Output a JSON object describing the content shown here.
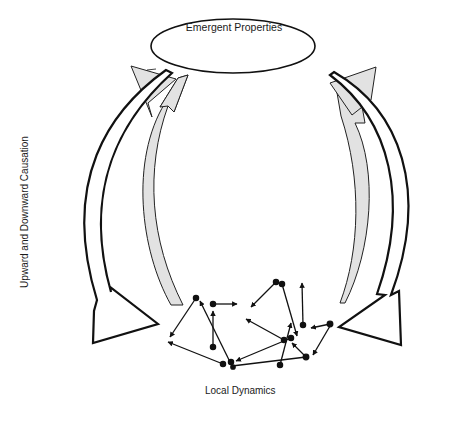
{
  "diagram": {
    "top_node": {
      "label": "Emergent Properties"
    },
    "bottom_node": {
      "label": "Local Dynamics"
    },
    "side_label": "Upward and Downward Causation",
    "colors": {
      "stroke": "#111111",
      "upward_fill": "#e2e2e2",
      "downward_fill": "#ffffff",
      "background": "#ffffff"
    },
    "arrows": {
      "left_upward": {
        "direction": "up",
        "fill": "gray"
      },
      "left_downward": {
        "direction": "down",
        "fill": "white"
      },
      "right_upward": {
        "direction": "up",
        "fill": "gray"
      },
      "right_downward": {
        "direction": "down",
        "fill": "white"
      }
    },
    "network": {
      "nodes": [
        [
          196,
          298
        ],
        [
          213,
          304
        ],
        [
          213,
          347
        ],
        [
          223,
          364
        ],
        [
          232,
          366
        ],
        [
          276,
          282
        ],
        [
          282,
          284
        ],
        [
          303,
          325
        ],
        [
          284,
          340
        ],
        [
          291,
          338
        ],
        [
          330,
          324
        ],
        [
          306,
          357
        ],
        [
          280,
          365
        ]
      ],
      "edges": [
        [
          [
            196,
            298
          ],
          [
            170,
            337
          ]
        ],
        [
          [
            213,
            304
          ],
          [
            237,
            304
          ]
        ],
        [
          [
            213,
            347
          ],
          [
            213,
            311
          ]
        ],
        [
          [
            223,
            364
          ],
          [
            168,
            342
          ]
        ],
        [
          [
            232,
            366
          ],
          [
            200,
            301
          ]
        ],
        [
          [
            276,
            282
          ],
          [
            251,
            307
          ]
        ],
        [
          [
            282,
            284
          ],
          [
            297,
            336
          ]
        ],
        [
          [
            303,
            325
          ],
          [
            302,
            283
          ]
        ],
        [
          [
            284,
            340
          ],
          [
            246,
            319
          ]
        ],
        [
          [
            291,
            338
          ],
          [
            236,
            361
          ]
        ],
        [
          [
            330,
            324
          ],
          [
            311,
            328
          ]
        ],
        [
          [
            330,
            326
          ],
          [
            313,
            355
          ]
        ],
        [
          [
            306,
            357
          ],
          [
            292,
            343
          ]
        ],
        [
          [
            280,
            365
          ],
          [
            291,
            323
          ]
        ],
        [
          [
            232,
            366
          ],
          [
            306,
            357
          ]
        ]
      ]
    }
  }
}
